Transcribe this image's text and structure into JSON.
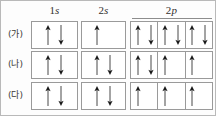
{
  "figure": {
    "title": "",
    "headers": [
      {
        "id": "1s",
        "n": "1",
        "l": "s"
      },
      {
        "id": "2s",
        "n": "2",
        "l": "s"
      },
      {
        "id": "2p",
        "n": "2",
        "l": "p"
      }
    ],
    "row_labels": [
      "(가)",
      "(나)",
      "(다)"
    ],
    "colors": {
      "border": "#9a9a9a",
      "outer_border": "#b9b9b9",
      "arrow": "#1a1a1a",
      "text": "#33302e",
      "background": "#fdfdfd"
    },
    "rows": [
      {
        "label": "(가)",
        "orbitals": {
          "1s": [
            "up",
            "down"
          ],
          "2s": [
            "up",
            "none"
          ],
          "2p": [
            [
              "up",
              "down"
            ],
            [
              "up",
              "down"
            ],
            [
              "up",
              "down"
            ]
          ]
        }
      },
      {
        "label": "(나)",
        "orbitals": {
          "1s": [
            "up",
            "down"
          ],
          "2s": [
            "up",
            "down"
          ],
          "2p": [
            [
              "up",
              "down"
            ],
            [
              "up",
              "none"
            ],
            [
              "up",
              "none"
            ]
          ]
        }
      },
      {
        "label": "(다)",
        "orbitals": {
          "1s": [
            "up",
            "down"
          ],
          "2s": [
            "up",
            "down"
          ],
          "2p": [
            [
              "up",
              "none"
            ],
            [
              "up",
              "none"
            ],
            [
              "up",
              "none"
            ]
          ]
        }
      }
    ]
  }
}
